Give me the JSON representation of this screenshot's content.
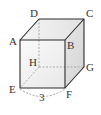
{
  "figure": {
    "type": "cube",
    "vertices": {
      "A": {
        "label": "A"
      },
      "B": {
        "label": "B"
      },
      "C": {
        "label": "C"
      },
      "D": {
        "label": "D"
      },
      "E": {
        "label": "E"
      },
      "F": {
        "label": "F"
      },
      "G": {
        "label": "G"
      },
      "H": {
        "label": "H"
      }
    },
    "edge_length_label": "3",
    "measured_edge": "EF",
    "colors": {
      "edge": "#2b2b2b",
      "hidden_edge": "#9a9a9a",
      "face_top": "#ececec",
      "face_front": "#f3f3f3",
      "face_side": "#dedede",
      "text": "#333333"
    }
  }
}
